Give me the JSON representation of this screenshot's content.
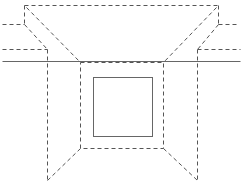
{
  "diagram": {
    "width": 246,
    "height": 182,
    "colors": {
      "background": "#ffffff",
      "dashed_stroke": "#555555",
      "solid_stroke": "#666666"
    },
    "dashed_segments": [
      {
        "name": "top-edge",
        "x1": 24,
        "y1": 5,
        "x2": 218,
        "y2": 5
      },
      {
        "name": "left-top-vertical",
        "x1": 24,
        "y1": 5,
        "x2": 24,
        "y2": 24
      },
      {
        "name": "right-top-vertical",
        "x1": 218,
        "y1": 5,
        "x2": 218,
        "y2": 24
      },
      {
        "name": "left-upper-horizontal",
        "x1": 2,
        "y1": 24,
        "x2": 24,
        "y2": 24
      },
      {
        "name": "right-upper-horizontal",
        "x1": 218,
        "y1": 24,
        "x2": 236,
        "y2": 24
      },
      {
        "name": "left-lower-horizontal",
        "x1": 2,
        "y1": 49,
        "x2": 47,
        "y2": 49
      },
      {
        "name": "right-lower-horizontal",
        "x1": 197,
        "y1": 49,
        "x2": 240,
        "y2": 49
      },
      {
        "name": "left-top-diagonal-inner",
        "x1": 26,
        "y1": 7,
        "x2": 80,
        "y2": 62
      },
      {
        "name": "right-top-diagonal-inner",
        "x1": 216,
        "y1": 7,
        "x2": 163,
        "y2": 62
      },
      {
        "name": "left-top-diagonal-outer",
        "x1": 24,
        "y1": 24,
        "x2": 47,
        "y2": 49
      },
      {
        "name": "right-top-diagonal-outer",
        "x1": 218,
        "y1": 24,
        "x2": 197,
        "y2": 49
      },
      {
        "name": "left-outer-vertical",
        "x1": 47,
        "y1": 49,
        "x2": 47,
        "y2": 180
      },
      {
        "name": "right-outer-vertical",
        "x1": 197,
        "y1": 49,
        "x2": 197,
        "y2": 180
      },
      {
        "name": "left-bottom-diagonal",
        "x1": 80,
        "y1": 148,
        "x2": 47,
        "y2": 180
      },
      {
        "name": "right-bottom-diagonal",
        "x1": 163,
        "y1": 148,
        "x2": 197,
        "y2": 180
      }
    ],
    "dashed_rects": [
      {
        "name": "inner-dashed-rect",
        "x": 80,
        "y": 62,
        "width": 83,
        "height": 86
      }
    ],
    "solid_segments": [
      {
        "name": "ground-line",
        "x1": 2,
        "y1": 61,
        "x2": 240,
        "y2": 61
      }
    ],
    "solid_rects": [
      {
        "name": "inner-solid-square",
        "x": 93,
        "y": 77,
        "width": 59,
        "height": 59
      }
    ]
  }
}
